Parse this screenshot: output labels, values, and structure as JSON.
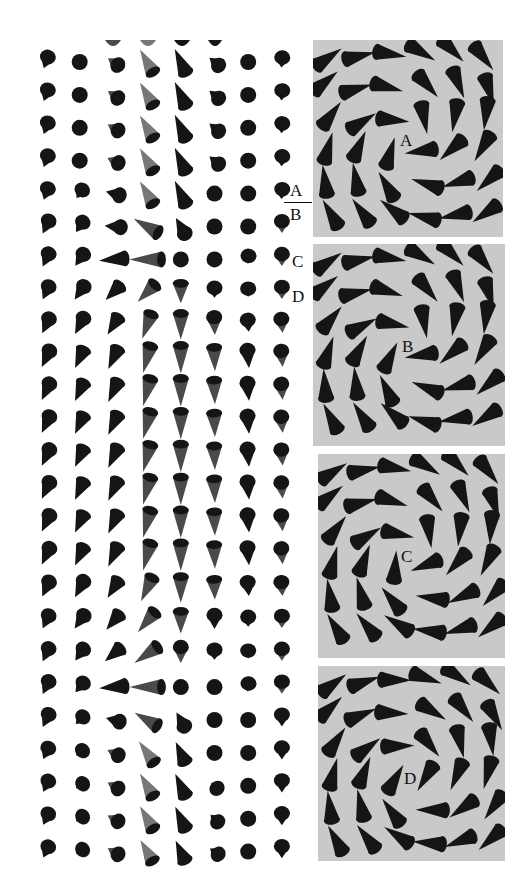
{
  "figure": {
    "type": "spin-texture-illustration",
    "colors": {
      "background": "#ffffff",
      "cone_dark": "#151515",
      "cone_mid": "#4a4a4a",
      "cone_light": "#777777",
      "panel_background": "#c9c9c9",
      "label_text": "#111111"
    }
  },
  "side_labels": [
    {
      "text": "A",
      "x": 290,
      "y": 182
    },
    {
      "text": "B",
      "x": 290,
      "y": 206
    },
    {
      "text": "C",
      "x": 292,
      "y": 253
    },
    {
      "text": "D",
      "x": 292,
      "y": 288
    }
  ],
  "side_divider": {
    "x": 284,
    "y": 202,
    "width": 28
  },
  "lattice": {
    "origin_x": 46,
    "origin_y": 62,
    "dx": 33.7,
    "dy": 32.9,
    "cols": 8,
    "note": "each cell = [tip_angle_deg (0=up, clockwise), length_px (0=dot), shade (0 dark..2 light)]",
    "rows": [
      [
        [
          200,
          12,
          0
        ],
        [
          0,
          0,
          0
        ],
        [
          305,
          12,
          1
        ],
        [
          330,
          26,
          2
        ],
        [
          335,
          26,
          0
        ],
        [
          310,
          12,
          0
        ],
        [
          0,
          0,
          0
        ],
        [
          185,
          10,
          0
        ]
      ],
      [
        [
          200,
          12,
          0
        ],
        [
          0,
          0,
          0
        ],
        [
          305,
          12,
          1
        ],
        [
          330,
          26,
          2
        ],
        [
          335,
          26,
          0
        ],
        [
          310,
          12,
          0
        ],
        [
          0,
          0,
          0
        ],
        [
          185,
          10,
          0
        ]
      ],
      [
        [
          200,
          12,
          0
        ],
        [
          0,
          0,
          0
        ],
        [
          300,
          12,
          1
        ],
        [
          330,
          26,
          2
        ],
        [
          335,
          26,
          0
        ],
        [
          310,
          12,
          0
        ],
        [
          0,
          0,
          0
        ],
        [
          185,
          10,
          0
        ]
      ],
      [
        [
          200,
          12,
          0
        ],
        [
          0,
          0,
          0
        ],
        [
          295,
          12,
          1
        ],
        [
          330,
          26,
          2
        ],
        [
          335,
          26,
          0
        ],
        [
          310,
          12,
          0
        ],
        [
          0,
          0,
          0
        ],
        [
          185,
          10,
          0
        ]
      ],
      [
        [
          200,
          12,
          0
        ],
        [
          215,
          10,
          0
        ],
        [
          285,
          14,
          0
        ],
        [
          330,
          26,
          2
        ],
        [
          335,
          26,
          0
        ],
        [
          0,
          0,
          0
        ],
        [
          0,
          0,
          0
        ],
        [
          185,
          10,
          0
        ]
      ],
      [
        [
          205,
          14,
          0
        ],
        [
          215,
          12,
          0
        ],
        [
          275,
          16,
          0
        ],
        [
          300,
          28,
          1
        ],
        [
          330,
          18,
          0
        ],
        [
          0,
          0,
          0
        ],
        [
          0,
          0,
          0
        ],
        [
          180,
          12,
          1
        ]
      ],
      [
        [
          205,
          14,
          0
        ],
        [
          215,
          14,
          0
        ],
        [
          265,
          26,
          0
        ],
        [
          270,
          32,
          1
        ],
        [
          0,
          0,
          0
        ],
        [
          0,
          0,
          0
        ],
        [
          185,
          8,
          0
        ],
        [
          180,
          12,
          1
        ]
      ],
      [
        [
          205,
          14,
          0
        ],
        [
          215,
          16,
          0
        ],
        [
          225,
          20,
          0
        ],
        [
          225,
          24,
          1
        ],
        [
          180,
          20,
          1
        ],
        [
          180,
          10,
          0
        ],
        [
          180,
          8,
          0
        ],
        [
          180,
          12,
          1
        ]
      ],
      [
        [
          205,
          16,
          0
        ],
        [
          208,
          18,
          0
        ],
        [
          212,
          20,
          0
        ],
        [
          200,
          26,
          1
        ],
        [
          180,
          26,
          1
        ],
        [
          178,
          18,
          1
        ],
        [
          175,
          12,
          0
        ],
        [
          175,
          14,
          1
        ]
      ],
      [
        [
          205,
          18,
          0
        ],
        [
          205,
          20,
          0
        ],
        [
          205,
          22,
          0
        ],
        [
          195,
          28,
          1
        ],
        [
          180,
          28,
          1
        ],
        [
          178,
          24,
          1
        ],
        [
          175,
          18,
          0
        ],
        [
          175,
          16,
          1
        ]
      ],
      [
        [
          205,
          18,
          0
        ],
        [
          205,
          20,
          0
        ],
        [
          205,
          22,
          0
        ],
        [
          195,
          28,
          1
        ],
        [
          180,
          28,
          1
        ],
        [
          178,
          24,
          1
        ],
        [
          175,
          18,
          0
        ],
        [
          175,
          16,
          1
        ]
      ],
      [
        [
          205,
          18,
          0
        ],
        [
          205,
          20,
          0
        ],
        [
          205,
          22,
          0
        ],
        [
          195,
          28,
          1
        ],
        [
          180,
          28,
          1
        ],
        [
          178,
          24,
          1
        ],
        [
          175,
          18,
          0
        ],
        [
          175,
          16,
          1
        ]
      ],
      [
        [
          205,
          18,
          0
        ],
        [
          205,
          20,
          0
        ],
        [
          205,
          22,
          0
        ],
        [
          195,
          28,
          1
        ],
        [
          180,
          28,
          1
        ],
        [
          178,
          24,
          1
        ],
        [
          175,
          18,
          0
        ],
        [
          175,
          16,
          1
        ]
      ],
      [
        [
          205,
          18,
          0
        ],
        [
          205,
          20,
          0
        ],
        [
          205,
          22,
          0
        ],
        [
          195,
          28,
          1
        ],
        [
          180,
          28,
          1
        ],
        [
          178,
          24,
          1
        ],
        [
          175,
          18,
          0
        ],
        [
          175,
          16,
          1
        ]
      ],
      [
        [
          205,
          18,
          0
        ],
        [
          205,
          20,
          0
        ],
        [
          205,
          22,
          0
        ],
        [
          195,
          28,
          1
        ],
        [
          180,
          28,
          1
        ],
        [
          178,
          24,
          1
        ],
        [
          175,
          18,
          0
        ],
        [
          175,
          16,
          1
        ]
      ],
      [
        [
          205,
          18,
          0
        ],
        [
          205,
          20,
          0
        ],
        [
          205,
          22,
          0
        ],
        [
          195,
          28,
          1
        ],
        [
          180,
          28,
          1
        ],
        [
          178,
          24,
          1
        ],
        [
          175,
          18,
          0
        ],
        [
          175,
          16,
          1
        ]
      ],
      [
        [
          205,
          16,
          0
        ],
        [
          208,
          18,
          0
        ],
        [
          212,
          20,
          0
        ],
        [
          205,
          26,
          1
        ],
        [
          180,
          26,
          1
        ],
        [
          178,
          20,
          1
        ],
        [
          175,
          14,
          0
        ],
        [
          175,
          14,
          1
        ]
      ],
      [
        [
          205,
          14,
          0
        ],
        [
          215,
          16,
          0
        ],
        [
          220,
          20,
          0
        ],
        [
          220,
          26,
          1
        ],
        [
          180,
          22,
          1
        ],
        [
          180,
          14,
          0
        ],
        [
          180,
          10,
          0
        ],
        [
          180,
          12,
          1
        ]
      ],
      [
        [
          205,
          14,
          0
        ],
        [
          215,
          14,
          0
        ],
        [
          230,
          20,
          0
        ],
        [
          235,
          28,
          1
        ],
        [
          180,
          16,
          1
        ],
        [
          180,
          10,
          0
        ],
        [
          180,
          8,
          0
        ],
        [
          180,
          12,
          1
        ]
      ],
      [
        [
          205,
          14,
          0
        ],
        [
          220,
          12,
          0
        ],
        [
          265,
          26,
          0
        ],
        [
          270,
          32,
          1
        ],
        [
          0,
          0,
          0
        ],
        [
          0,
          0,
          0
        ],
        [
          185,
          8,
          0
        ],
        [
          180,
          12,
          1
        ]
      ],
      [
        [
          205,
          14,
          0
        ],
        [
          225,
          10,
          0
        ],
        [
          285,
          14,
          0
        ],
        [
          300,
          26,
          1
        ],
        [
          330,
          16,
          0
        ],
        [
          0,
          0,
          0
        ],
        [
          0,
          0,
          0
        ],
        [
          180,
          12,
          0
        ]
      ],
      [
        [
          205,
          12,
          0
        ],
        [
          230,
          8,
          0
        ],
        [
          295,
          12,
          1
        ],
        [
          325,
          26,
          2
        ],
        [
          335,
          22,
          0
        ],
        [
          0,
          0,
          0
        ],
        [
          0,
          0,
          0
        ],
        [
          180,
          12,
          0
        ]
      ],
      [
        [
          205,
          12,
          0
        ],
        [
          235,
          8,
          0
        ],
        [
          300,
          12,
          1
        ],
        [
          330,
          26,
          2
        ],
        [
          335,
          24,
          0
        ],
        [
          315,
          8,
          0
        ],
        [
          0,
          0,
          0
        ],
        [
          180,
          12,
          0
        ]
      ],
      [
        [
          205,
          12,
          0
        ],
        [
          235,
          8,
          0
        ],
        [
          300,
          12,
          1
        ],
        [
          330,
          26,
          2
        ],
        [
          335,
          24,
          0
        ],
        [
          315,
          10,
          0
        ],
        [
          0,
          0,
          0
        ],
        [
          180,
          12,
          0
        ]
      ],
      [
        [
          205,
          12,
          0
        ],
        [
          235,
          8,
          0
        ],
        [
          300,
          12,
          1
        ],
        [
          330,
          24,
          2
        ],
        [
          335,
          22,
          0
        ],
        [
          305,
          10,
          0
        ],
        [
          0,
          0,
          0
        ],
        [
          180,
          12,
          0
        ]
      ]
    ],
    "partial_top_row": [
      {
        "x": 113,
        "w": 16,
        "shade": 1
      },
      {
        "x": 148,
        "w": 16,
        "shade": 2
      },
      {
        "x": 182,
        "w": 16,
        "shade": 0
      },
      {
        "x": 215,
        "w": 14,
        "shade": 0
      }
    ]
  },
  "panels": [
    {
      "label": "A",
      "x": 313,
      "y": 40,
      "w": 190,
      "h": 197,
      "cx": 95,
      "cy": 100,
      "label_x": 87,
      "label_y": 92,
      "twist": 55
    },
    {
      "label": "B",
      "x": 313,
      "y": 244,
      "w": 192,
      "h": 202,
      "cx": 95,
      "cy": 102,
      "label_x": 89,
      "label_y": 94,
      "twist": 60
    },
    {
      "label": "C",
      "x": 318,
      "y": 454,
      "w": 187,
      "h": 204,
      "cx": 90,
      "cy": 100,
      "label_x": 83,
      "label_y": 94,
      "twist": 50
    },
    {
      "label": "D",
      "x": 318,
      "y": 666,
      "w": 187,
      "h": 195,
      "cx": 95,
      "cy": 110,
      "label_x": 86,
      "label_y": 104,
      "twist": 35
    }
  ]
}
